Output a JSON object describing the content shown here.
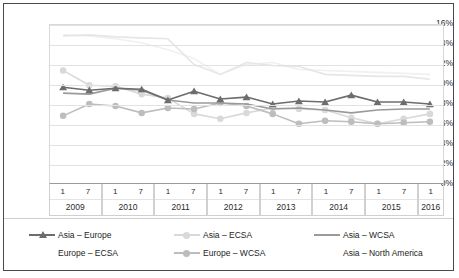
{
  "chart_data": {
    "type": "line",
    "title": "",
    "xlabel": "",
    "ylabel": "",
    "ylim": [
      0,
      16
    ],
    "ytick_step": 2,
    "ytick_labels": [
      "16%",
      "14%",
      "12%",
      "10%",
      "8%",
      "6%",
      "4%",
      "2%",
      "0%"
    ],
    "grid": true,
    "legend_position": "bottom",
    "x_categories": [
      "2009-1",
      "2009-7",
      "2010-1",
      "2010-7",
      "2011-1",
      "2011-7",
      "2012-1",
      "2012-7",
      "2013-1",
      "2013-7",
      "2014-1",
      "2014-7",
      "2015-1",
      "2015-7",
      "2016-1"
    ],
    "x_year_groups": [
      {
        "year": "2009",
        "months": [
          "1",
          "7"
        ]
      },
      {
        "year": "2010",
        "months": [
          "1",
          "7"
        ]
      },
      {
        "year": "2011",
        "months": [
          "1",
          "7"
        ]
      },
      {
        "year": "2012",
        "months": [
          "1",
          "7"
        ]
      },
      {
        "year": "2013",
        "months": [
          "1",
          "7"
        ]
      },
      {
        "year": "2014",
        "months": [
          "1",
          "7"
        ]
      },
      {
        "year": "2015",
        "months": [
          "1",
          "7"
        ]
      },
      {
        "year": "2016",
        "months": [
          "1"
        ]
      }
    ],
    "series": [
      {
        "name": "Asia – Europe",
        "color": "#6d6d6d",
        "marker": "triangle",
        "values": [
          9.7,
          9.4,
          9.6,
          9.5,
          8.4,
          9.3,
          8.5,
          8.7,
          8.0,
          8.3,
          8.2,
          8.9,
          8.2,
          8.2,
          8.0
        ]
      },
      {
        "name": "Asia – ECSA",
        "color": "#d9d9d9",
        "marker": "circle",
        "values": [
          11.4,
          9.9,
          9.8,
          9.0,
          8.6,
          7.0,
          6.5,
          7.1,
          7.6,
          7.5,
          7.4,
          6.6,
          6.0,
          6.5,
          7.0
        ]
      },
      {
        "name": "Asia – WCSA",
        "color": "#9a9a9a",
        "marker": "none",
        "values": [
          9.1,
          9.0,
          9.6,
          9.4,
          8.4,
          8.1,
          8.1,
          8.0,
          7.5,
          7.6,
          7.4,
          7.1,
          7.4,
          7.5,
          7.5
        ]
      },
      {
        "name": "Europe – ECSA",
        "color": "#e6e6e6",
        "marker": "none",
        "values": [
          14.9,
          15.0,
          14.8,
          14.7,
          14.6,
          12.0,
          11.0,
          12.2,
          11.9,
          11.8,
          11.0,
          10.9,
          10.8,
          10.8,
          10.5
        ]
      },
      {
        "name": "Europe – WCSA",
        "color": "#bdbdbd",
        "marker": "circle",
        "values": [
          6.8,
          8.0,
          7.8,
          7.1,
          7.6,
          7.5,
          8.1,
          7.8,
          7.0,
          6.0,
          6.3,
          6.2,
          6.0,
          6.1,
          6.2
        ]
      },
      {
        "name": "Asia – North America",
        "color": "#f0f0f0",
        "marker": "none",
        "values": [
          15.0,
          14.9,
          14.6,
          14.2,
          13.5,
          12.6,
          11.0,
          12.0,
          12.2,
          11.5,
          11.4,
          11.3,
          11.2,
          11.1,
          11.0
        ]
      }
    ],
    "legend_layout": [
      [
        "Asia – Europe",
        "Europe – ECSA"
      ],
      [
        "Asia – ECSA",
        "Europe – WCSA"
      ],
      [
        "Asia – WCSA",
        "Asia – North America"
      ]
    ]
  }
}
